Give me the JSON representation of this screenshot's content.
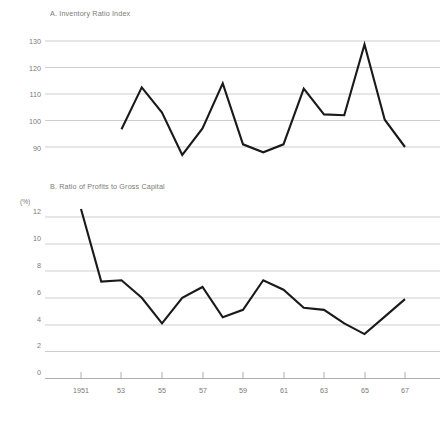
{
  "figure": {
    "background_color": "#ffffff",
    "line_color": "#1a1a1a",
    "grid_color": "#b9b9b9",
    "text_color": "#7a7a7a"
  },
  "panel_a": {
    "title": "A. Inventory Ratio Index",
    "y_ticks": [
      "130",
      "120",
      "110",
      "100",
      "90"
    ]
  },
  "panel_b": {
    "title": "B. Ratio of Profits to Gross Capital",
    "unit": "(%)",
    "y_ticks": [
      "12",
      "10",
      "8",
      "6",
      "4",
      "2",
      "0"
    ]
  },
  "x_axis": {
    "ticks": [
      "1951",
      "53",
      "55",
      "57",
      "59",
      "61",
      "63",
      "65",
      "67"
    ]
  },
  "chart_data": [
    {
      "type": "line",
      "title": "A. Inventory Ratio Index",
      "xlabel": "",
      "ylabel": "",
      "ylim": [
        85,
        132
      ],
      "xlim": [
        1951,
        1967
      ],
      "grid": true,
      "legend": "none",
      "yticks": [
        90,
        100,
        110,
        120,
        130
      ],
      "x": [
        1953,
        1954,
        1955,
        1956,
        1957,
        1958,
        1959,
        1960,
        1961,
        1962,
        1963,
        1964,
        1965,
        1966,
        1967
      ],
      "values": [
        96.7,
        112.5,
        103.0,
        87.0,
        97.0,
        114.0,
        91.0,
        88.0,
        91.0,
        112.0,
        102.3,
        102.0,
        128.7,
        100.3,
        90.0
      ]
    },
    {
      "type": "line",
      "title": "B. Ratio of Profits to Gross Capital",
      "xlabel": "",
      "ylabel": "(%)",
      "ylim": [
        0,
        13
      ],
      "xlim": [
        1951,
        1967
      ],
      "grid": true,
      "legend": "none",
      "yticks": [
        0,
        2,
        4,
        6,
        8,
        10,
        12
      ],
      "x": [
        1951,
        1952,
        1953,
        1954,
        1955,
        1956,
        1957,
        1958,
        1959,
        1960,
        1961,
        1962,
        1963,
        1964,
        1965,
        1966,
        1967
      ],
      "values": [
        12.6,
        7.2,
        7.3,
        6.0,
        4.1,
        6.0,
        6.8,
        4.55,
        5.1,
        7.3,
        6.6,
        5.25,
        5.1,
        4.1,
        3.3,
        4.6,
        5.9
      ]
    }
  ]
}
